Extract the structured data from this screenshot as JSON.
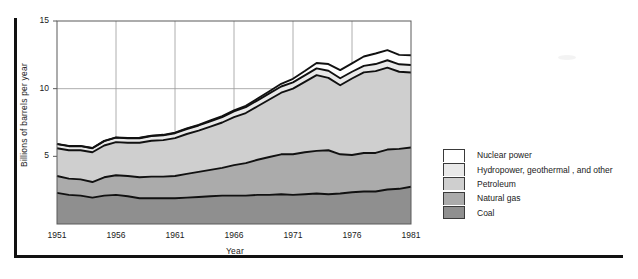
{
  "figure": {
    "name": "stacked-area-energy-chart"
  },
  "axes": {
    "ylabel": "Billions of barrels per year",
    "xlabel": "Year",
    "yticks": [
      "5",
      "10",
      "15"
    ],
    "ytick_values": [
      5,
      10,
      15
    ],
    "xticks": [
      "1951",
      "1956",
      "1961",
      "1966",
      "1971",
      "1976",
      "1981"
    ],
    "xtick_values": [
      1951,
      1956,
      1961,
      1966,
      1971,
      1976,
      1981
    ]
  },
  "legend": {
    "items": [
      {
        "label": "Nuclear power",
        "color": "#ffffff"
      },
      {
        "label": "Hydropower, geothermal , and other",
        "color": "#e9e9e9"
      },
      {
        "label": "Petroleum",
        "color": "#cfcfcf"
      },
      {
        "label": "Natural gas",
        "color": "#ababab"
      },
      {
        "label": "Coal",
        "color": "#8f8f8f"
      }
    ]
  },
  "chart_data": {
    "type": "area",
    "title": "",
    "xlabel": "Year",
    "ylabel": "Billions of barrels per year",
    "xlim": [
      1951,
      1981
    ],
    "ylim": [
      0,
      15
    ],
    "yticks": [
      5,
      10,
      15
    ],
    "xticks": [
      1951,
      1956,
      1961,
      1966,
      1971,
      1976,
      1981
    ],
    "grid": true,
    "stacked": true,
    "legend_position": "right",
    "x": [
      1951,
      1952,
      1953,
      1954,
      1955,
      1956,
      1957,
      1958,
      1959,
      1960,
      1961,
      1962,
      1963,
      1964,
      1965,
      1966,
      1967,
      1968,
      1969,
      1970,
      1971,
      1972,
      1973,
      1974,
      1975,
      1976,
      1977,
      1978,
      1979,
      1980,
      1981
    ],
    "series": [
      {
        "name": "Coal",
        "color": "#8f8f8f",
        "values": [
          2.3,
          2.15,
          2.1,
          1.95,
          2.1,
          2.15,
          2.05,
          1.9,
          1.9,
          1.9,
          1.9,
          1.95,
          2.0,
          2.05,
          2.1,
          2.1,
          2.1,
          2.15,
          2.15,
          2.2,
          2.15,
          2.2,
          2.25,
          2.2,
          2.25,
          2.35,
          2.4,
          2.4,
          2.55,
          2.6,
          2.75
        ]
      },
      {
        "name": "Natural gas",
        "color": "#ababab",
        "values": [
          1.25,
          1.2,
          1.2,
          1.15,
          1.35,
          1.45,
          1.5,
          1.55,
          1.6,
          1.6,
          1.65,
          1.75,
          1.85,
          1.95,
          2.05,
          2.25,
          2.4,
          2.6,
          2.8,
          2.95,
          3.0,
          3.1,
          3.15,
          3.25,
          2.9,
          2.75,
          2.85,
          2.85,
          2.95,
          2.95,
          2.9
        ]
      },
      {
        "name": "Petroleum",
        "color": "#cfcfcf",
        "values": [
          2.05,
          2.1,
          2.15,
          2.2,
          2.35,
          2.45,
          2.45,
          2.55,
          2.65,
          2.7,
          2.8,
          2.95,
          3.05,
          3.2,
          3.35,
          3.55,
          3.7,
          3.95,
          4.25,
          4.55,
          4.85,
          5.2,
          5.6,
          5.35,
          5.1,
          5.65,
          5.95,
          6.05,
          6.05,
          5.7,
          5.55
        ]
      },
      {
        "name": "Hydropower, geothermal , and other",
        "color": "#e9e9e9",
        "values": [
          0.3,
          0.3,
          0.3,
          0.3,
          0.32,
          0.33,
          0.33,
          0.34,
          0.35,
          0.35,
          0.36,
          0.37,
          0.38,
          0.39,
          0.4,
          0.42,
          0.43,
          0.44,
          0.45,
          0.46,
          0.47,
          0.48,
          0.5,
          0.52,
          0.52,
          0.5,
          0.48,
          0.52,
          0.55,
          0.55,
          0.55
        ]
      },
      {
        "name": "Nuclear power",
        "color": "#ffffff",
        "values": [
          0.02,
          0.02,
          0.02,
          0.02,
          0.02,
          0.02,
          0.03,
          0.03,
          0.03,
          0.04,
          0.04,
          0.05,
          0.05,
          0.06,
          0.07,
          0.08,
          0.1,
          0.13,
          0.16,
          0.2,
          0.26,
          0.32,
          0.4,
          0.5,
          0.6,
          0.62,
          0.7,
          0.78,
          0.75,
          0.7,
          0.72
        ]
      }
    ]
  }
}
